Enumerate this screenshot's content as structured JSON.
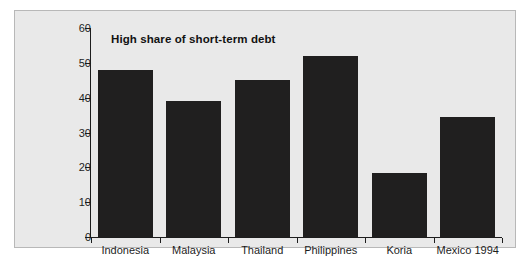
{
  "chart_data": {
    "type": "bar",
    "title": "High share of short-term debt",
    "xlabel": "",
    "ylabel": "",
    "categories": [
      "Indonesia",
      "Malaysia",
      "Thailand",
      "Philippines",
      "Koria",
      "Mexico 1994"
    ],
    "values": [
      48,
      39,
      45,
      52,
      18.5,
      34.5
    ],
    "ylim": [
      0,
      60
    ],
    "ytick_labels": [
      "0",
      "10",
      "20",
      "30",
      "40",
      "50",
      "60"
    ],
    "ytick_values": [
      0,
      10,
      20,
      30,
      40,
      50,
      60
    ],
    "grid": false,
    "legend": null,
    "series_name": "Short-term debt share",
    "bar_color": "#201f1f",
    "plot_background": "#e9e9e9",
    "axis_color": "#1d1d1d",
    "border_color": "#b8b8b8"
  }
}
